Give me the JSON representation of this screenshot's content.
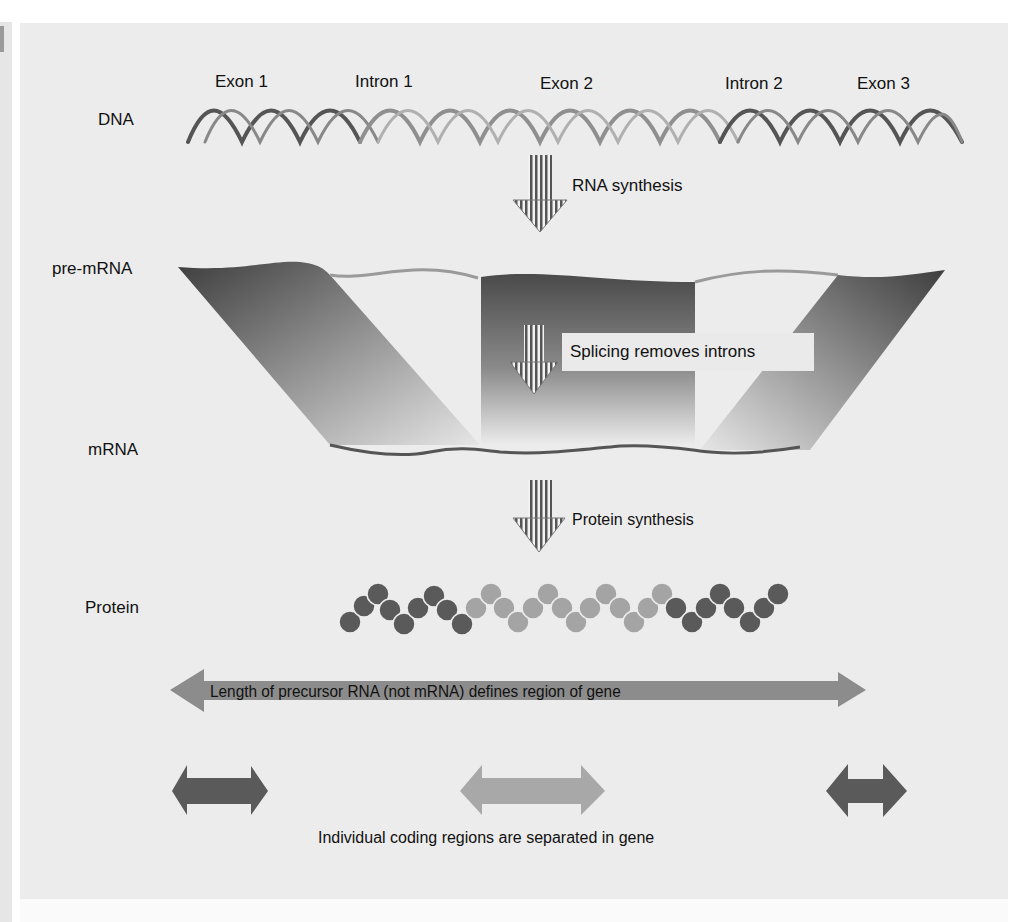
{
  "figure": {
    "rows": {
      "dna": "DNA",
      "pre_mrna": "pre-mRNA",
      "mrna": "mRNA",
      "protein": "Protein"
    },
    "segments": [
      {
        "label": "Exon 1",
        "type": "exon",
        "shade": "#4f4f4f"
      },
      {
        "label": "Intron 1",
        "type": "intron",
        "shade": "#9a9a9a"
      },
      {
        "label": "Exon 2",
        "type": "exon",
        "shade": "#9a9a9a"
      },
      {
        "label": "Intron 2",
        "type": "intron",
        "shade": "#9a9a9a"
      },
      {
        "label": "Exon 3",
        "type": "exon",
        "shade": "#4f4f4f"
      }
    ],
    "steps": {
      "rna_synthesis": "RNA synthesis",
      "splicing": "Splicing removes introns",
      "protein_synthesis": "Protein synthesis"
    },
    "annotations": {
      "gene_region": "Length of precursor RNA (not mRNA) defines region of gene",
      "coding_regions": "Individual coding regions are separated in gene"
    },
    "colors": {
      "background": "#ececec",
      "dark_exon": "#505050",
      "light_exon": "#a0a0a0",
      "big_arrow": "#8c8c8c"
    }
  }
}
